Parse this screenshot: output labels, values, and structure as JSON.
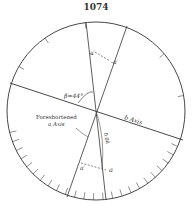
{
  "page": {
    "number": "1074"
  },
  "diagram": {
    "type": "stereographic-projection",
    "labels": {
      "beta": "β=44°",
      "b_axis": "b Axis",
      "foreshortened_line1": "Foreshortened",
      "foreshortened_line2": "a Axis",
      "a_prime_top": "a′",
      "minus_a_prime": "-a′",
      "a_prime_bottom": "a′",
      "a": "a",
      "distance": "0.08"
    },
    "circle": {
      "cx": 96,
      "cy": 111,
      "r": 89
    },
    "colors": {
      "line": "#333333",
      "background": "#ffffff"
    }
  }
}
